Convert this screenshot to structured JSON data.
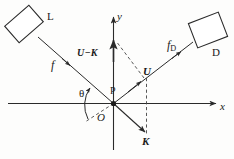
{
  "figure": {
    "background_color": "#fdfdfc",
    "stroke_color": "#2a2a2a",
    "labels": {
      "laser_box": "L",
      "detector_box": "D",
      "incident_frequency": "f",
      "detected_frequency_base": "f",
      "detected_frequency_sub": "D",
      "y_axis": "y",
      "x_axis": "x",
      "scattering_vector": "U−K",
      "u_vector": "U",
      "k_vector": "K",
      "scattering_point": "P",
      "origin": "O",
      "angle": "θ"
    },
    "elements": {
      "laser_box_name": "laser-source-box",
      "detector_box_name": "detector-box",
      "incident_ray_name": "incident-beam-ray",
      "scattered_ray_name": "scattered-beam-ray",
      "x_axis_name": "x-axis",
      "y_axis_name": "y-axis",
      "k_vector_name": "k-wavevector-arrow",
      "u_minus_k_vector_name": "u-minus-k-vector-arrow",
      "angle_arc_name": "theta-angle-arc",
      "dashed_guides_name": "dashed-construction-lines"
    }
  }
}
